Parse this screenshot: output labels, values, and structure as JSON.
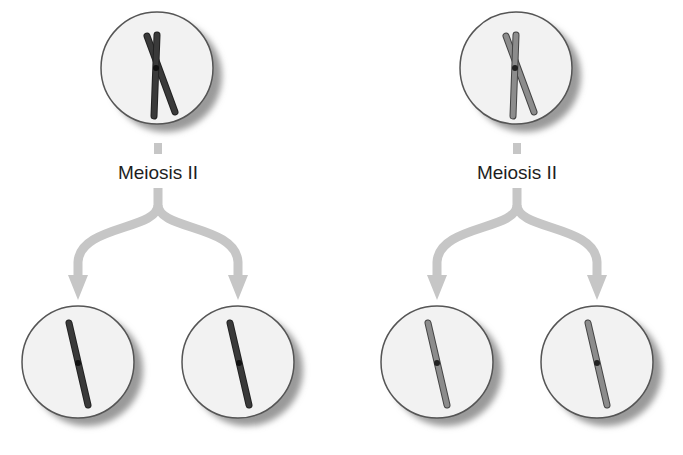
{
  "colors": {
    "cell_fill": "#f2f2f2",
    "cell_stroke": "#555555",
    "cell_shadow": "#9a9a9a",
    "arrow": "#c6c6c6",
    "chromosome_dark": "#333333",
    "chromosome_light": "#8c8c8c",
    "label_text": "#1e1e1e"
  },
  "panels": [
    {
      "id": "left",
      "label": "Meiosis II",
      "chromosome_shade": "dark",
      "parent_cell": {
        "cx": 157,
        "cy": 68,
        "r": 56,
        "content": "duplicated chromosome (two sister chromatids joined at centromere)"
      },
      "daughter_cells": [
        {
          "cx": 78,
          "cy": 362,
          "r": 56,
          "content": "single chromatid"
        },
        {
          "cx": 238,
          "cy": 362,
          "r": 56,
          "content": "single chromatid"
        }
      ]
    },
    {
      "id": "right",
      "label": "Meiosis II",
      "chromosome_shade": "light",
      "parent_cell": {
        "cx": 516,
        "cy": 68,
        "r": 56,
        "content": "duplicated chromosome (two sister chromatids joined at centromere)"
      },
      "daughter_cells": [
        {
          "cx": 437,
          "cy": 362,
          "r": 56,
          "content": "single chromatid"
        },
        {
          "cx": 597,
          "cy": 362,
          "r": 56,
          "content": "single chromatid"
        }
      ]
    }
  ]
}
